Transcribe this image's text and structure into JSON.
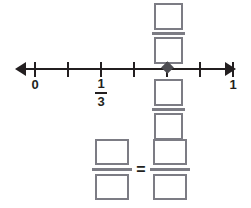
{
  "worksheet": {
    "type": "fraction-number-line-exercise",
    "number_line": {
      "start_label": "0",
      "end_label": "1",
      "midpoint_label_numerator": "1",
      "midpoint_label_denominator": "3",
      "tick_count": 7,
      "interval_count": 6,
      "tick_positions_px": [
        35,
        68,
        101,
        134,
        167,
        200,
        233
      ],
      "labels": [
        {
          "text": "0",
          "tick_index": 0,
          "x": 35
        },
        {
          "text": "1",
          "tick_index": 6,
          "x": 233
        }
      ],
      "fraction_label": {
        "numerator": "1",
        "denominator": "3",
        "tick_index": 2,
        "x": 101
      },
      "marker": {
        "name": "point-marker",
        "shape": "diamond",
        "tick_index": 4,
        "x": 167,
        "color": "#4d4d52"
      },
      "axis_color": "#231f20",
      "has_left_arrow": true,
      "has_right_arrow": true
    },
    "answer_fraction_above": {
      "numerator": "",
      "denominator": "",
      "placeholder": ""
    },
    "answer_fraction_below": {
      "numerator": "",
      "denominator": "",
      "placeholder": ""
    },
    "equation": {
      "left": {
        "numerator": "",
        "denominator": ""
      },
      "operator": "=",
      "right": {
        "numerator": "",
        "denominator": ""
      }
    },
    "colors": {
      "ink": "#231f20",
      "box_border": "#7c7c84",
      "marker": "#4d4d52",
      "background": "#ffffff"
    }
  }
}
